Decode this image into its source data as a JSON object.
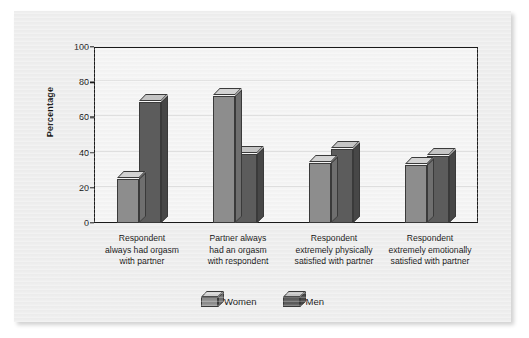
{
  "figure": {
    "background_color": "#eeeeee",
    "plot_background_color": "#f4f4f4",
    "frame_color": "#1a1a1a"
  },
  "chart_data": {
    "type": "bar",
    "title": "",
    "xlabel": "",
    "ylabel": "Percentage",
    "ylim": [
      0,
      100
    ],
    "yticks": [
      0,
      20,
      40,
      60,
      80,
      100
    ],
    "ytick_labels": [
      "0",
      "20",
      "40",
      "60",
      "80",
      "100"
    ],
    "grid": true,
    "grid_axis": "y",
    "legend_position": "bottom-center",
    "three_d": true,
    "categories": [
      "Respondent always had orgasm with partner",
      "Partner always had an orgasm with respondent",
      "Respondent extremely physically satisfied with partner",
      "Respondent extremely emotionally satisfied with partner"
    ],
    "category_label_lines": [
      [
        "Respondent",
        "always had orgasm",
        "with partner"
      ],
      [
        "Partner always",
        "had an orgasm",
        "with respondent"
      ],
      [
        "Respondent",
        "extremely physically",
        "satisfied with partner"
      ],
      [
        "Respondent",
        "extremely emotionally",
        "satisfied with partner"
      ]
    ],
    "series": [
      {
        "name": "Women",
        "color": "#8d8d8d",
        "top_color": "#d2d2d2",
        "side_color": "#6f6f6f",
        "values": [
          25,
          72,
          34,
          33
        ]
      },
      {
        "name": "Men",
        "color": "#5c5c5c",
        "top_color": "#c4c4c4",
        "side_color": "#474747",
        "values": [
          69,
          39,
          42,
          38
        ]
      }
    ]
  },
  "legend": {
    "items": [
      {
        "label": "Women"
      },
      {
        "label": "Men"
      }
    ]
  }
}
